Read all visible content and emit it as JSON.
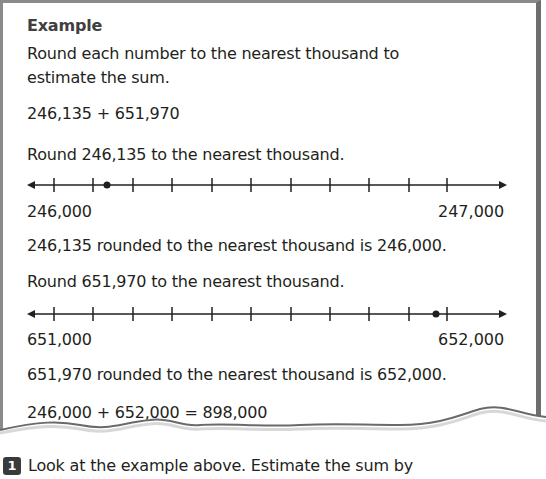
{
  "example": {
    "title": "Example",
    "intro_line1": "Round each number to the nearest thousand to",
    "intro_line2": "estimate the sum.",
    "expression": "246,135 + 651,970",
    "step1_prompt": "Round 246,135 to the nearest thousand.",
    "line1": {
      "left_label": "246,000",
      "right_label": "247,000",
      "ticks": 11,
      "point_value": 246135,
      "min": 246000,
      "max": 247000
    },
    "step1_result": "246,135 rounded to the nearest thousand is 246,000.",
    "step2_prompt": "Round 651,970 to the nearest thousand.",
    "line2": {
      "left_label": "651,000",
      "right_label": "652,000",
      "ticks": 11,
      "point_value": 651970,
      "min": 651000,
      "max": 652000
    },
    "step2_result": "651,970 rounded to the nearest thousand is 652,000.",
    "final": "246,000 + 652,000 = 898,000"
  },
  "question": {
    "number": "1",
    "text": "Look at the example above. Estimate the sum by"
  }
}
